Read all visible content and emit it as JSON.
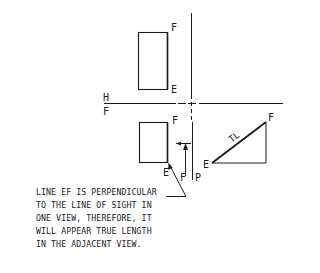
{
  "diagram": {
    "colors": {
      "line": "#1a1a1a",
      "background": "#ffffff"
    },
    "fold_line": {
      "upper_label": "H",
      "lower_label": "F"
    },
    "top_view": {
      "point_top": "F",
      "point_bottom": "E"
    },
    "front_view": {
      "point_top": "F",
      "point_bottom": "E",
      "edge_label_f": "F",
      "edge_label_p": "P"
    },
    "aux_view": {
      "point_start": "E",
      "point_end": "F",
      "tl_label": "TL"
    },
    "note": {
      "lines": [
        "LINE EF IS PERPENDICULAR",
        "TO THE LINE OF SIGHT IN",
        "ONE VIEW, THEREFORE, IT",
        "WILL APPEAR TRUE LENGTH",
        "IN THE ADJACENT VIEW."
      ]
    }
  }
}
